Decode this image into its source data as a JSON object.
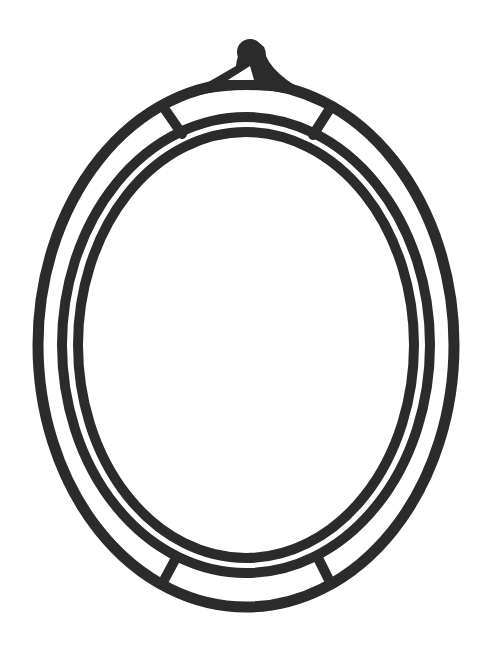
{
  "image": {
    "subject": "oval frame line drawing",
    "description": "Black-and-white outline of an oval picture frame with a hanging tab at the top, three concentric oval bands, and four short crossbars linking the outer and inner bands near the top and bottom."
  },
  "colors": {
    "ink": "#2b2b2b",
    "background": "#ffffff"
  },
  "frame": {
    "center": [
      246,
      345
    ],
    "outer_ellipse": {
      "rx": 208,
      "ry": 262,
      "stroke": 11
    },
    "middle_ellipse": {
      "rx": 184,
      "ry": 228,
      "stroke": 10
    },
    "inner_ellipse": {
      "rx": 168,
      "ry": 213,
      "stroke": 10
    },
    "crossbars": [
      {
        "name": "top-left",
        "from": [
          164,
          108
        ],
        "to": [
          182,
          134
        ]
      },
      {
        "name": "top-right",
        "from": [
          329,
          110
        ],
        "to": [
          313,
          135
        ]
      },
      {
        "name": "bottom-left",
        "from": [
          176,
          558
        ],
        "to": [
          162,
          584
        ]
      },
      {
        "name": "bottom-right",
        "from": [
          318,
          558
        ],
        "to": [
          331,
          584
        ]
      }
    ],
    "hanging_tab": {
      "knob_center": [
        250,
        52
      ],
      "triangle_hole": [
        [
          228,
          80
        ],
        [
          254,
          80
        ],
        [
          250,
          66
        ]
      ]
    }
  }
}
